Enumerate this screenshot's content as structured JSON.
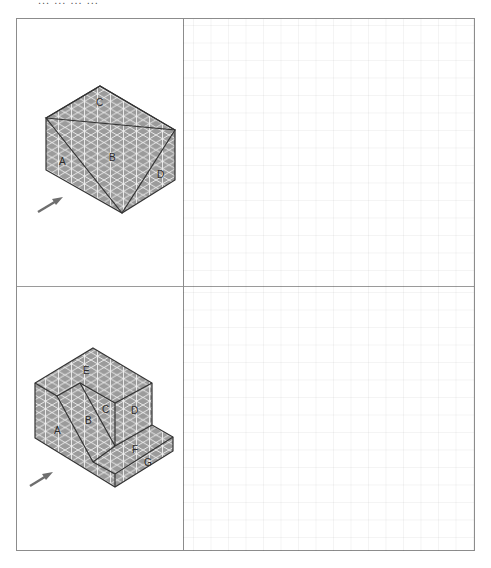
{
  "header": {
    "text": "...   ...   ...   ..."
  },
  "worksheet": {
    "rows": [
      {
        "figure": {
          "name": "prism-with-triangular-cut",
          "face_labels": [
            "A",
            "B",
            "C",
            "D"
          ],
          "viewing_arrow": "direction-arrow"
        },
        "answer_area": {
          "type": "square-grid",
          "content": ""
        }
      },
      {
        "figure": {
          "name": "stepped-block",
          "face_labels": [
            "A",
            "B",
            "C",
            "D",
            "E",
            "F",
            "G"
          ],
          "viewing_arrow": "direction-arrow"
        },
        "answer_area": {
          "type": "square-grid",
          "content": ""
        }
      }
    ]
  },
  "colors": {
    "face_fill": "#9b9b9b",
    "iso_grid": "#f2f2f2",
    "edge": "#333333",
    "arrow": "#6e6e6e",
    "border": "#8c8c8c"
  },
  "labels": {
    "fig1": {
      "A": "A",
      "B": "B",
      "C": "C",
      "D": "D"
    },
    "fig2": {
      "A": "A",
      "B": "B",
      "C": "C",
      "D": "D",
      "E": "E",
      "F": "F",
      "G": "G"
    }
  }
}
